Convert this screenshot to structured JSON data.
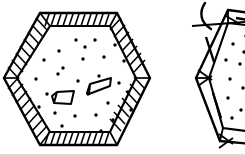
{
  "figure": {
    "style": "black-and-white technical line art",
    "background_color": "#ffffff",
    "ink_color": "#000000",
    "frame_border_color": "#b9b9b9",
    "canvas": {
      "width": 245,
      "height": 156
    },
    "alt_text": "Two hexagonal panels drawn in ink: a complete hexagon with a hatched frame band and a speckled interior containing two nail shapes, and a partial hexagon at the right edge with a dashed frame band and a curved hook marker."
  },
  "objects": {
    "main_hexagon": {
      "label": "hexagonal panel with hatched frame",
      "outer_vertices": [
        [
          40,
          13
        ],
        [
          117,
          13
        ],
        [
          150,
          78
        ],
        [
          117,
          145
        ],
        [
          40,
          145
        ],
        [
          4,
          78
        ]
      ],
      "inner_vertices": [
        [
          50,
          26
        ],
        [
          110,
          26
        ],
        [
          136,
          78
        ],
        [
          110,
          132
        ],
        [
          50,
          132
        ],
        [
          17,
          78
        ]
      ],
      "band_hatch_counts": [
        13,
        10,
        10,
        13,
        10,
        10
      ],
      "fill": "#ffffff",
      "stroke_width": 2.2
    },
    "side_hexagon": {
      "label": "partial hexagonal panel with dashed frame",
      "outer_vertices": [
        [
          228,
          10
        ],
        [
          261,
          14
        ],
        [
          278,
          76
        ],
        [
          250,
          142
        ],
        [
          222,
          140
        ],
        [
          196,
          78
        ]
      ],
      "inner_vertices": [
        [
          227,
          22
        ],
        [
          256,
          25
        ],
        [
          268,
          76
        ],
        [
          244,
          130
        ],
        [
          224,
          128
        ],
        [
          208,
          78
        ]
      ],
      "clipped_at_right_edge": true,
      "dash_marks": 4,
      "stroke_width": 2.2
    },
    "stipple": {
      "label": "speckled interior texture",
      "dot_color": "#000000",
      "main_dots": [
        [
          59,
          51
        ],
        [
          76,
          40
        ],
        [
          95,
          40
        ],
        [
          115,
          45
        ],
        [
          63,
          68
        ],
        [
          83,
          59
        ],
        [
          104,
          57
        ],
        [
          124,
          61
        ],
        [
          36,
          79
        ],
        [
          58,
          74
        ],
        [
          78,
          81
        ],
        [
          99,
          76
        ],
        [
          119,
          83
        ],
        [
          47,
          94
        ],
        [
          68,
          100
        ],
        [
          88,
          94
        ],
        [
          108,
          103
        ],
        [
          128,
          92
        ],
        [
          55,
          113
        ],
        [
          75,
          116
        ],
        [
          96,
          115
        ],
        [
          113,
          120
        ],
        [
          39,
          107
        ],
        [
          131,
          110
        ],
        [
          62,
          126
        ],
        [
          101,
          131
        ],
        [
          85,
          47
        ],
        [
          44,
          60
        ]
      ],
      "side_dots": [
        [
          233,
          44
        ],
        [
          244,
          36
        ],
        [
          226,
          60
        ],
        [
          240,
          64
        ],
        [
          230,
          79
        ],
        [
          243,
          88
        ],
        [
          228,
          98
        ],
        [
          241,
          110
        ],
        [
          232,
          118
        ],
        [
          245,
          52
        ]
      ]
    },
    "nails": [
      {
        "label": "nail pointing down-left",
        "head": [
          [
            53,
            101
          ],
          [
            57,
            95
          ]
        ],
        "shaft": [
          [
            57,
            95
          ],
          [
            75,
            93
          ],
          [
            72,
            104
          ],
          [
            55,
            104
          ]
        ],
        "orientation": "down-left"
      },
      {
        "label": "nail pointing up-right",
        "head": [
          [
            88,
            92
          ],
          [
            92,
            85
          ]
        ],
        "shaft": [
          [
            92,
            85
          ],
          [
            112,
            79
          ],
          [
            110,
            87
          ],
          [
            90,
            93
          ]
        ],
        "orientation": "up-right"
      }
    ],
    "hook_marker": {
      "label": "curved hook annotation",
      "path": "M 205 4 C 200 12, 201 22, 210 28",
      "stroke_width": 2.4
    },
    "leader_line": {
      "label": "horizontal leader line",
      "from": [
        193,
        26
      ],
      "to": [
        245,
        22
      ],
      "stroke_width": 2.2
    }
  },
  "annotations": {
    "figure_caption": "",
    "reference_numerals": []
  }
}
